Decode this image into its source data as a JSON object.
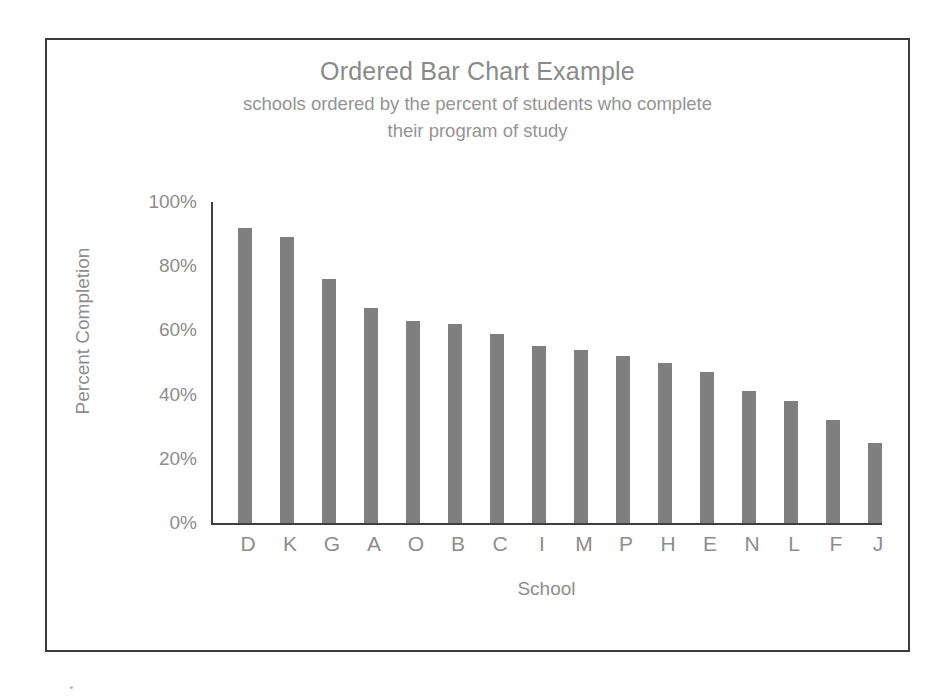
{
  "chart_data": {
    "type": "bar",
    "title": "Ordered Bar Chart Example",
    "subtitle_lines": [
      "schools ordered by the percent of students who complete",
      "their program of study"
    ],
    "xlabel": "School",
    "ylabel": "Percent Completion",
    "categories": [
      "D",
      "K",
      "G",
      "A",
      "O",
      "B",
      "C",
      "I",
      "M",
      "P",
      "H",
      "E",
      "N",
      "L",
      "F",
      "J"
    ],
    "values": [
      92,
      89,
      76,
      67,
      63,
      62,
      59,
      55,
      54,
      52,
      50,
      47,
      41,
      38,
      32,
      25
    ],
    "value_labels": [
      "92%",
      "89%",
      "76%",
      "67%",
      "63%",
      "62%",
      "59%",
      "55%",
      "54%",
      "52%",
      "50%",
      "47%",
      "41%",
      "38%",
      "32%",
      "25%"
    ],
    "ylim": [
      0,
      100
    ],
    "ytick_values": [
      0,
      20,
      40,
      60,
      80,
      100
    ],
    "ytick_labels": [
      "0%",
      "20%",
      "40%",
      "60%",
      "80%",
      "100%"
    ],
    "grid": false,
    "legend": false,
    "bar_color": "#7f7f7f",
    "axis_color": "#3f3f3f",
    "text_color": "#8d8d8d",
    "frame_color": "#3c3c3c",
    "background": "#ffffff"
  }
}
